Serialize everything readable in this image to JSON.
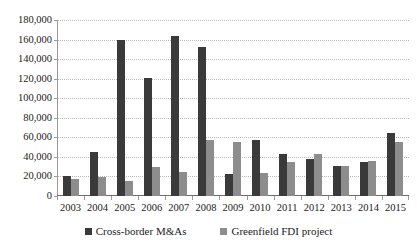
{
  "chart_data": {
    "type": "bar",
    "title": "",
    "subtitle": "",
    "xlabel": "",
    "ylabel": "",
    "categories": [
      "2003",
      "2004",
      "2005",
      "2006",
      "2007",
      "2008",
      "2009",
      "2010",
      "2011",
      "2012",
      "2013",
      "2014",
      "2015"
    ],
    "series": [
      {
        "name": "Cross-border M&As",
        "color": "#3a3a3a",
        "values": [
          20000,
          45500,
          160000,
          121000,
          164000,
          152000,
          23000,
          57000,
          43000,
          38000,
          31000,
          35000,
          64000
        ]
      },
      {
        "name": "Greenfield FDI project",
        "color": "#8d8d8d",
        "values": [
          17000,
          19500,
          15000,
          30000,
          25000,
          57000,
          55000,
          24000,
          35000,
          43000,
          31000,
          36000,
          55000
        ]
      }
    ],
    "ylim": [
      0,
      180000
    ],
    "ytick_step": 20000,
    "ytick_labels": [
      "0",
      "20,000",
      "40,000",
      "60,000",
      "80,000",
      "100,000",
      "120,000",
      "140,000",
      "160,000",
      "180,000"
    ],
    "grid": true,
    "grid_axis": "y",
    "legend_position": "bottom"
  }
}
